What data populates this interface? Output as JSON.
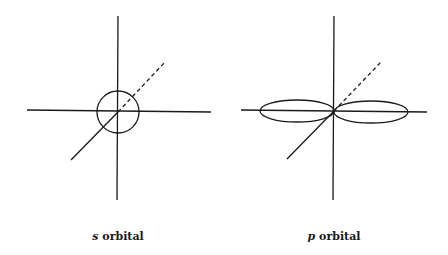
{
  "figures": [
    {
      "id": "s-orbital",
      "caption": {
        "symbol": "s",
        "text": " orbital"
      },
      "shape": "sphere (circle)",
      "center": [
        118,
        112
      ],
      "radius": 21
    },
    {
      "id": "p-orbital",
      "caption": {
        "symbol": "p",
        "text": " orbital"
      },
      "shape": "dumbbell (two lobes along horizontal axis)",
      "center": [
        334,
        111
      ]
    }
  ],
  "colors": {
    "stroke": "#1a1a1a",
    "background": "#ffffff"
  }
}
